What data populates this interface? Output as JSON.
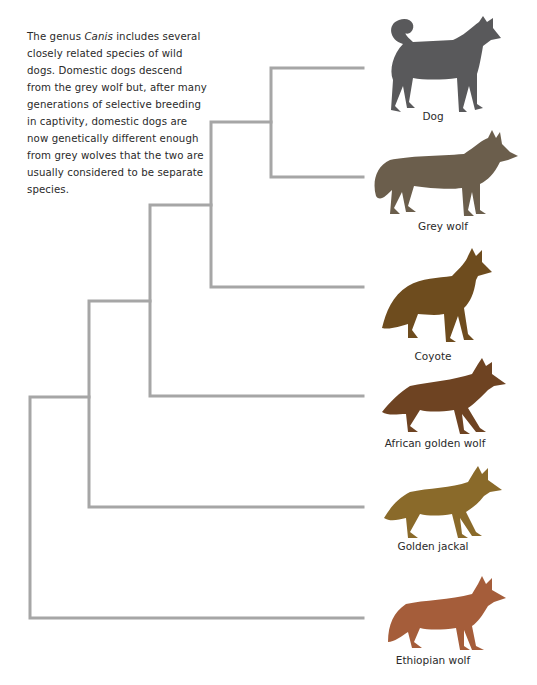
{
  "intro": {
    "before_italic": "The genus ",
    "italic": "Canis",
    "after_italic": " includes several closely related species of wild dogs. Domestic dogs descend from the grey wolf but, after many generations of selective breeding in captivity, domestic dogs are now genetically different enough from grey wolves that the two are usually considered to be separate species."
  },
  "tree": {
    "line_color": "#a6a6a6",
    "leaves": [
      {
        "name": "Dog",
        "color": "#59595b",
        "icon": "dog-silhouette-icon"
      },
      {
        "name": "Grey wolf",
        "color": "#6b5e4c",
        "icon": "wolf-silhouette-icon"
      },
      {
        "name": "Coyote",
        "color": "#6e4c1e",
        "icon": "coyote-silhouette-icon"
      },
      {
        "name": "African golden wolf",
        "color": "#6e4322",
        "icon": "wolf-silhouette-icon"
      },
      {
        "name": "Golden jackal",
        "color": "#8a6a2a",
        "icon": "jackal-silhouette-icon"
      },
      {
        "name": "Ethiopian wolf",
        "color": "#a55d3a",
        "icon": "wolf-silhouette-icon"
      }
    ],
    "topology": "((((Dog, Grey wolf), Coyote), African golden wolf), Golden jackal), Ethiopian wolf"
  }
}
